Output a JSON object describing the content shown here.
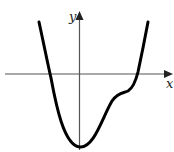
{
  "figure": {
    "type": "function-graph",
    "axes": {
      "x_label": "x",
      "y_label": "y",
      "axis_color": "#555555"
    },
    "curve": {
      "description": "quartic-like curve: steep descent crossing x-axis left of origin, minimum just below origin on y-axis, rising with a flat shoulder (inflection) right of origin, then crossing x-axis and rising steeply",
      "color": "#000000",
      "features": {
        "left_root": "negative x",
        "minimum": "at x = 0, below x-axis",
        "inflection_shoulder": "positive x, below x-axis",
        "right_root": "positive x"
      }
    }
  }
}
